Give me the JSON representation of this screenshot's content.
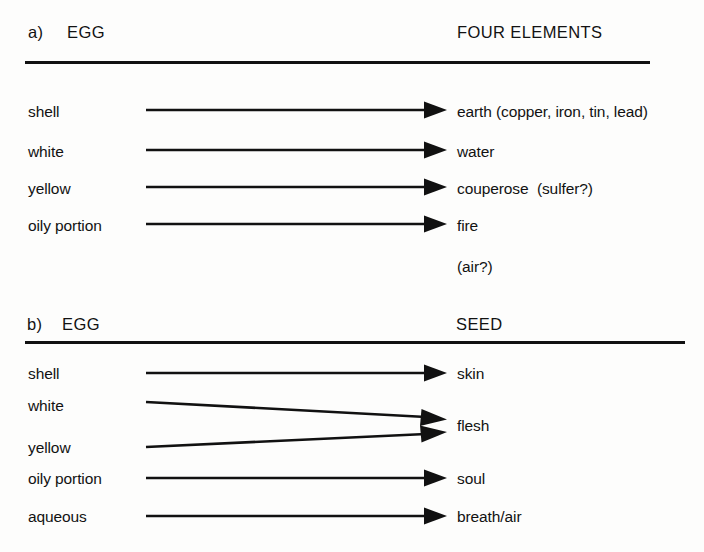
{
  "figure": {
    "background_color": "#fdfdfc",
    "ink_color": "#111111"
  },
  "panels": [
    {
      "id": "a",
      "tag": "a)",
      "left_heading": "EGG",
      "right_heading": "FOUR ELEMENTS",
      "rows": [
        {
          "left": "shell",
          "right": "earth (copper, iron, tin, lead)",
          "arrow": true
        },
        {
          "left": "white",
          "right": "water",
          "arrow": true
        },
        {
          "left": "yellow",
          "right": "couperose  (sulfer?)",
          "arrow": true
        },
        {
          "left": "oily portion",
          "right": "fire",
          "arrow": true
        },
        {
          "left": "",
          "right": "(air?)",
          "arrow": false
        }
      ]
    },
    {
      "id": "b",
      "tag": "b)",
      "left_heading": "EGG",
      "right_heading": "SEED",
      "rows": [
        {
          "left": "shell",
          "right": "skin",
          "arrow": true
        },
        {
          "left": "white",
          "right": "flesh",
          "arrow": true
        },
        {
          "left": "yellow",
          "right": "",
          "arrow": true
        },
        {
          "left": "oily portion",
          "right": "soul",
          "arrow": true
        },
        {
          "left": "aqueous",
          "right": "breath/air",
          "arrow": true
        }
      ]
    }
  ],
  "panel_a": {
    "tag": "a)",
    "left_heading": "EGG",
    "right_heading": "FOUR ELEMENTS",
    "row0_left": "shell",
    "row0_right": "earth (copper, iron, tin, lead)",
    "row1_left": "white",
    "row1_right": "water",
    "row2_left": "yellow",
    "row2_right": "couperose  (sulfer?)",
    "row3_left": "oily portion",
    "row3_right": "fire",
    "row4_right": "(air?)"
  },
  "panel_b": {
    "tag": "b)",
    "left_heading": "EGG",
    "right_heading": "SEED",
    "row0_left": "shell",
    "row0_right": "skin",
    "row1_left": "white",
    "row2_left": "yellow",
    "row12_right": "flesh",
    "row3_left": "oily portion",
    "row3_right": "soul",
    "row4_left": "aqueous",
    "row4_right": "breath/air"
  }
}
